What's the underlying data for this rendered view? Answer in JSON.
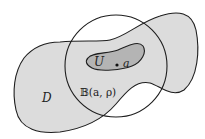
{
  "diagram": {
    "labels": {
      "domain": "D",
      "subset": "U",
      "point": "a",
      "ball": "𝔹(a, ρ)"
    },
    "colors": {
      "domain_fill": "#dcdcdc",
      "subset_fill": "#b4b4b4",
      "stroke": "#1e1e1e",
      "background": "#ffffff"
    },
    "circle": {
      "cx": 116,
      "cy": 66,
      "r": 51
    }
  }
}
